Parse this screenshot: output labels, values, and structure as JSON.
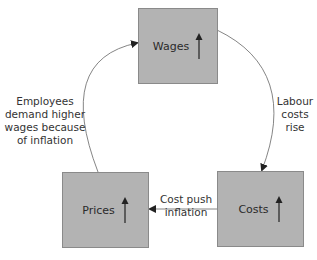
{
  "nodes": {
    "wages": {
      "label": "Wages",
      "indicator": "up-arrow-icon"
    },
    "costs": {
      "label": "Costs",
      "indicator": "up-arrow-icon"
    },
    "prices": {
      "label": "Prices",
      "indicator": "up-arrow-icon"
    }
  },
  "edges": {
    "wages_to_costs": {
      "label_line1": "Labour",
      "label_line2": "costs",
      "label_line3": "rise"
    },
    "costs_to_prices": {
      "label_line1": "Cost push",
      "label_line2": "inflation"
    },
    "prices_to_wages": {
      "label_line1": "Employees",
      "label_line2": "demand higher",
      "label_line3": "wages because",
      "label_line4": "of inflation"
    }
  },
  "colors": {
    "box_fill": "#b3b3b3",
    "box_border": "#8a8a8a",
    "line": "#555555"
  }
}
